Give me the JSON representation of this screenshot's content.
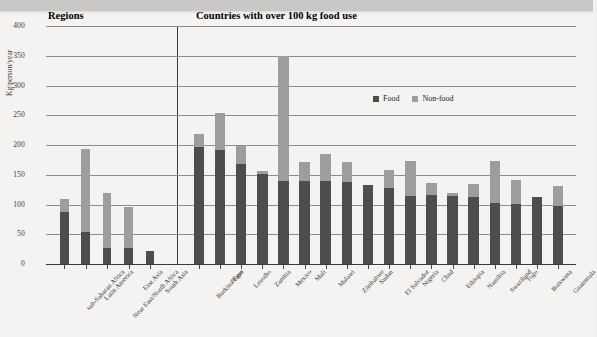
{
  "chart_data": {
    "type": "bar",
    "stacked": true,
    "title": "",
    "xlabel": "",
    "ylabel": "Kg/person/year",
    "ylim": [
      0,
      400
    ],
    "yticks": [
      0,
      50,
      100,
      150,
      200,
      250,
      300,
      350,
      400
    ],
    "grid": true,
    "legend_position": "inside-top-center",
    "series": [
      {
        "name": "Food",
        "color": "#4d4d4d"
      },
      {
        "name": "Non-food",
        "color": "#9d9d9d"
      }
    ],
    "panels": [
      {
        "heading": "Regions",
        "categories": [
          "sub-Saharan Africa",
          "Latin America",
          "Near East/North Africa",
          "East Asia",
          "South Asia"
        ],
        "food": [
          88,
          53,
          27,
          27,
          22
        ],
        "nonfood": [
          22,
          140,
          93,
          69,
          0
        ],
        "total": [
          110,
          193,
          120,
          96,
          22
        ]
      },
      {
        "heading": "Countries with over 100 kg food use",
        "categories": [
          "Burkina Faso",
          "Niger",
          "Lesotho",
          "Zambia",
          "Mexico",
          "Mali",
          "Malawi",
          "Zimbabwe",
          "Sudan",
          "El Salvador",
          "Nigeria",
          "Chad",
          "Ethiopia",
          "Namibia",
          "Swaziland",
          "Togo",
          "Botswana",
          "Guatemala"
        ],
        "food": [
          196,
          191,
          168,
          151,
          140,
          140,
          140,
          138,
          133,
          127,
          115,
          116,
          114,
          113,
          103,
          101,
          112,
          98
        ],
        "nonfood": [
          22,
          62,
          30,
          6,
          210,
          32,
          45,
          34,
          0,
          31,
          58,
          20,
          5,
          22,
          70,
          40,
          0,
          33
        ],
        "total": [
          218,
          253,
          198,
          157,
          350,
          172,
          185,
          172,
          133,
          158,
          173,
          136,
          119,
          135,
          173,
          141,
          112,
          131
        ]
      }
    ]
  },
  "legend": {
    "food_label": "Food",
    "nonfood_label": "Non-food"
  },
  "axis": {
    "y_title": "Kg/person/year"
  }
}
